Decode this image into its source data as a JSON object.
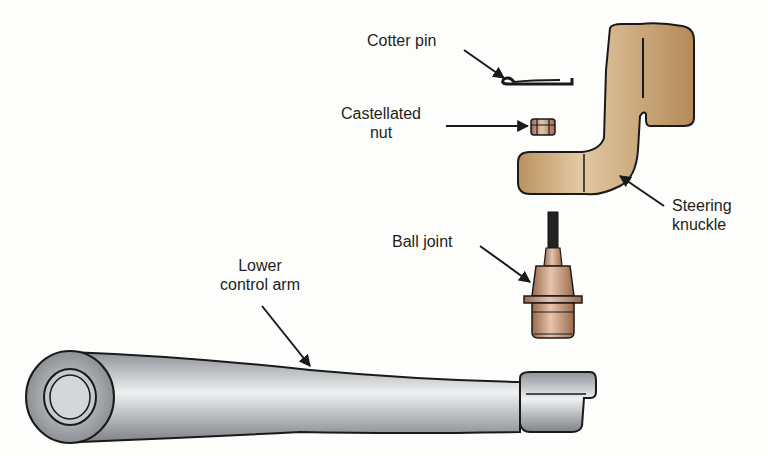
{
  "diagram": {
    "labels": {
      "cotter_pin": "Cotter pin",
      "castellated_nut_line1": "Castellated",
      "castellated_nut_line2": "nut",
      "steering_knuckle_line1": "Steering",
      "steering_knuckle_line2": "knuckle",
      "ball_joint": "Ball joint",
      "lower_control_arm_line1": "Lower",
      "lower_control_arm_line2": "control arm"
    },
    "colors": {
      "bronze": "#c9a27a",
      "copper": "#b8866a",
      "steel": "#b9bcbf",
      "outline": "#1a1a1a"
    }
  }
}
